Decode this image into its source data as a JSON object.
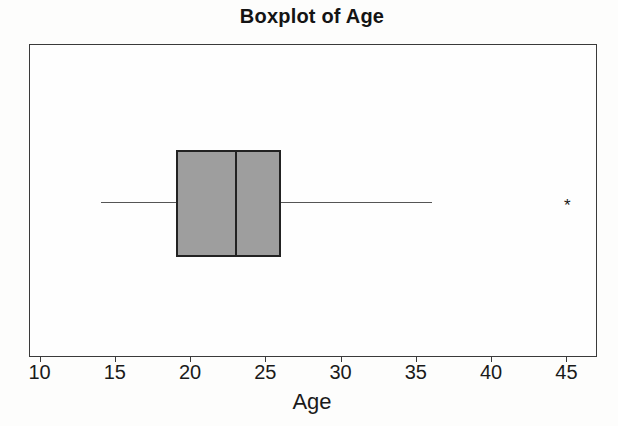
{
  "title": "Boxplot of Age",
  "chart_data": {
    "type": "boxplot",
    "orientation": "horizontal",
    "title": "Boxplot of Age",
    "xlabel": "Age",
    "xlim": [
      9.3,
      46.9
    ],
    "xticks": [
      10,
      15,
      20,
      25,
      30,
      35,
      40,
      45
    ],
    "grid": false,
    "series": [
      {
        "name": "Age",
        "whisker_low": 14,
        "q1": 19,
        "median": 23,
        "q3": 26,
        "whisker_high": 36,
        "outliers": [
          45
        ]
      }
    ],
    "outlier_marker": "*",
    "colors": {
      "box_fill": "#9e9e9e",
      "box_border": "#222222",
      "whisker": "#555555",
      "plot_border": "#3a3a3a",
      "text": "#1a1a1a"
    }
  }
}
